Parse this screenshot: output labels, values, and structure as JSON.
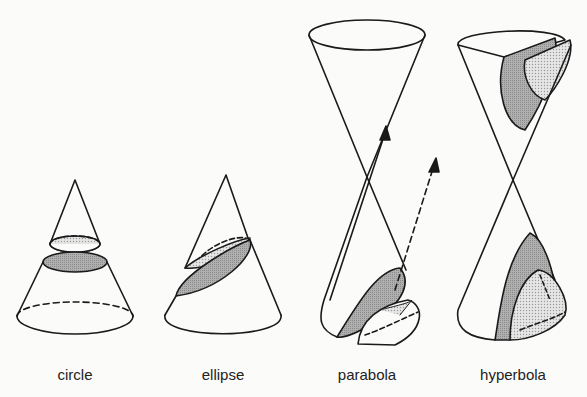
{
  "figure": {
    "type": "conic-sections",
    "colors": {
      "line": "#1a1a1a",
      "shade_dark": "#a9a9a9",
      "shade_light": "#dcdcdc",
      "background": "#fbfbfa"
    },
    "panels": [
      {
        "id": "circle",
        "label": "circle",
        "x": 75
      },
      {
        "id": "ellipse",
        "label": "ellipse",
        "x": 223
      },
      {
        "id": "parabola",
        "label": "parabola",
        "x": 367
      },
      {
        "id": "hyperbola",
        "label": "hyperbola",
        "x": 513
      }
    ]
  }
}
